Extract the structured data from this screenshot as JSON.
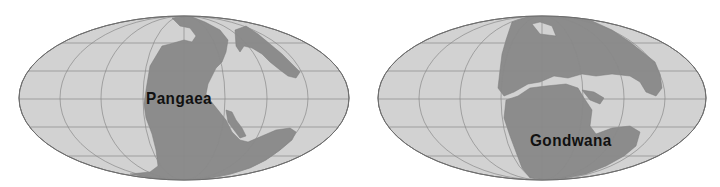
{
  "maps": [
    {
      "id": "pangaea",
      "label": "Pangaea",
      "colors": {
        "ocean": "#d2d2d2",
        "land": "#8c8c8c",
        "grid": "#8a8a8a",
        "text": "#111111"
      }
    },
    {
      "id": "gondwana",
      "label": "Gondwana",
      "colors": {
        "ocean": "#d2d2d2",
        "land": "#8c8c8c",
        "grid": "#8a8a8a",
        "text": "#111111"
      }
    }
  ]
}
